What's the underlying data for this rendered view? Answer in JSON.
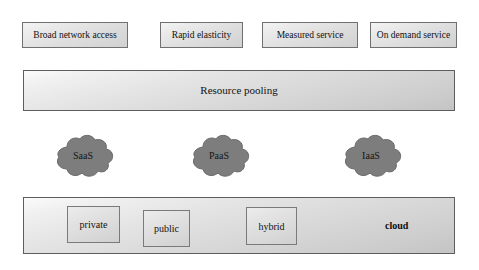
{
  "diagram": {
    "background_color": "#ffffff"
  },
  "characteristics": {
    "boxes": [
      {
        "label": "Broad network access"
      },
      {
        "label": "Rapid elasticity"
      },
      {
        "label": "Measured service"
      },
      {
        "label": "On demand service"
      }
    ]
  },
  "resource_pooling": {
    "label": "Resource pooling"
  },
  "service_models": {
    "clouds": [
      {
        "label": "SaaS",
        "icon": "cloud-icon",
        "color": "#7d7d7d"
      },
      {
        "label": "PaaS",
        "icon": "cloud-icon",
        "color": "#7d7d7d"
      },
      {
        "label": "IaaS",
        "icon": "cloud-icon",
        "color": "#7d7d7d"
      }
    ]
  },
  "deployment_models": {
    "boxes": [
      {
        "label": "private"
      },
      {
        "label": "public"
      },
      {
        "label": "hybrid"
      }
    ],
    "cloud_label": "cloud"
  },
  "colors": {
    "panel_border": "#6f6f6f",
    "panel_fill_light": "#f2f2f2",
    "panel_fill_dark": "#c9c9c9",
    "cloud_fill": "#7d7d7d",
    "text": "#111111"
  }
}
